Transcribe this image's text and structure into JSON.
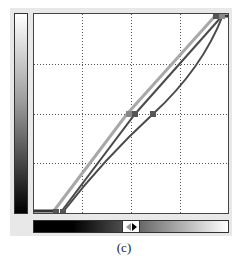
{
  "caption": "(c)",
  "colors": {
    "grid": "#555555",
    "curve_light": "#a8a8a8",
    "curve_dark": "#4a4a4a",
    "point": "#555555"
  },
  "graph": {
    "grid_divisions": 4,
    "curves": [
      {
        "name": "light-curve",
        "points": [
          [
            19,
            198
          ],
          [
            93,
            100
          ],
          [
            182,
            1
          ]
        ]
      },
      {
        "name": "dark-line",
        "points": [
          [
            27,
            198
          ],
          [
            101,
            100
          ],
          [
            189,
            1
          ]
        ]
      },
      {
        "name": "dark-curve",
        "points": [
          [
            29,
            198
          ],
          [
            70,
            150
          ],
          [
            119,
            100
          ],
          [
            189,
            1
          ]
        ]
      }
    ],
    "control_points": [
      [
        96,
        100
      ],
      [
        101,
        100
      ],
      [
        119,
        100
      ],
      [
        182,
        2
      ],
      [
        189,
        2
      ],
      [
        22,
        198
      ],
      [
        29,
        198
      ]
    ]
  },
  "slider": {
    "left_icon": "triangle-left-icon",
    "right_icon": "triangle-right-icon"
  }
}
